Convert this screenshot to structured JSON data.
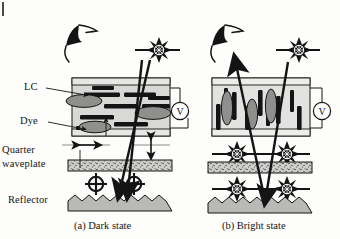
{
  "figure": {
    "type": "schematic-cross-section",
    "background_color": "#fdfdfb",
    "ink_color": "#141414",
    "cell_fill": "#d8d8d6",
    "dye_fill": "#9a9a98",
    "waveplate_fill": "#cfcfcd",
    "reflector_fill": "#b9b9b7"
  },
  "labels": {
    "lc": "LC",
    "dye": "Dye",
    "quarter_waveplate_line1": "Quarter",
    "quarter_waveplate_line2": "waveplate",
    "reflector": "Reflector"
  },
  "captions": {
    "panel_a": "(a) Dark state",
    "panel_b": "(b) Bright state"
  },
  "panels": [
    {
      "id": "a",
      "state": "dark",
      "caption": "(a) Dark state",
      "lc_orientation": "homogeneous-planar-horizontal",
      "dye_orientation": "horizontal",
      "voltage_applied": "off",
      "voltmeter_symbol": "V",
      "lc_rod_count": 9,
      "dye_ellipse_count": 4,
      "incident_ray": "absorbed",
      "exit_ray": "none",
      "optic_axis_markers": [
        "horizontal-double-arrow",
        "vertical-double-arrow"
      ],
      "polarization_symbols": [
        "circular-polarization",
        "circular-polarization"
      ],
      "starburst_count": 1
    },
    {
      "id": "b",
      "state": "bright",
      "caption": "(b) Bright state",
      "lc_orientation": "homeotropic-vertical",
      "dye_orientation": "vertical",
      "voltage_applied": "on",
      "voltmeter_symbol": "V",
      "lc_rod_count": 9,
      "dye_ellipse_count": 4,
      "incident_ray": "transmitted",
      "exit_ray": "reflected-to-observer",
      "starburst_count": 5
    }
  ],
  "symbols": {
    "observer": "eye-icon",
    "voltmeter": "V",
    "light_polarization": "starburst-icon",
    "circular_polarization": "crossed-circle-icon"
  }
}
